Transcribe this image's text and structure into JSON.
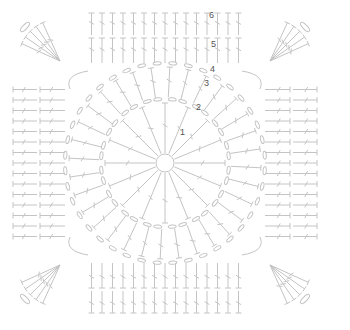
{
  "diagram": {
    "type": "crochet-granny-square-chart",
    "stroke_color": "#c4c4c4",
    "label_color": "#555555",
    "center": [
      165,
      163
    ],
    "rounds": [
      {
        "id": 1,
        "label": "1",
        "kind": "double-crochet-ring",
        "label_pos": [
          182,
          135
        ]
      },
      {
        "id": 2,
        "label": "2",
        "kind": "chain-arcs",
        "label_pos": [
          198,
          110
        ]
      },
      {
        "id": 3,
        "label": "3",
        "kind": "double-crochet",
        "label_pos": [
          206,
          86
        ]
      },
      {
        "id": 4,
        "label": "4",
        "kind": "chain-arcs",
        "label_pos": [
          212,
          70
        ]
      },
      {
        "id": 5,
        "label": "5",
        "kind": "double-crochet-square",
        "label_pos": [
          213,
          45
        ]
      },
      {
        "id": 6,
        "label": "6",
        "kind": "double-crochet-square",
        "label_pos": [
          211,
          16
        ]
      }
    ]
  }
}
